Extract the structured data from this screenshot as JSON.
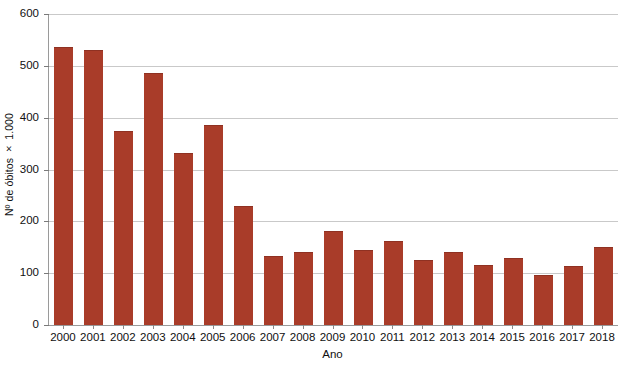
{
  "chart_data": {
    "type": "bar",
    "title": "",
    "xlabel": "Ano",
    "ylabel": "Nº de óbitos × 1.000",
    "categories": [
      "2000",
      "2001",
      "2002",
      "2003",
      "2004",
      "2005",
      "2006",
      "2007",
      "2008",
      "2009",
      "2010",
      "2011",
      "2012",
      "2013",
      "2014",
      "2015",
      "2016",
      "2017",
      "2018"
    ],
    "values": [
      535,
      528,
      373,
      485,
      330,
      384,
      228,
      132,
      139,
      180,
      142,
      161,
      124,
      138,
      113,
      128,
      94,
      111,
      148
    ],
    "ylim": [
      0,
      600
    ],
    "yticks": [
      0,
      100,
      200,
      300,
      400,
      500,
      600
    ],
    "ytick_labels": [
      "0",
      "100",
      "200",
      "300",
      "400",
      "500",
      "600"
    ],
    "grid": true,
    "grid_axis": "y",
    "legend": false,
    "series": [
      {
        "name": "Nº de óbitos × 1.000",
        "color": "#a93c29",
        "values": [
          535,
          528,
          373,
          485,
          330,
          384,
          228,
          132,
          139,
          180,
          142,
          161,
          124,
          138,
          113,
          128,
          94,
          111,
          148
        ]
      }
    ]
  },
  "axes": {
    "y_title": "Nº de óbitos × 1.000",
    "x_title": "Ano"
  },
  "colors": {
    "bar": "#a93c29",
    "gridline": "#c9c9c9",
    "axis": "#9a9a9a",
    "text": "#101010",
    "background": "#ffffff"
  },
  "caption": {
    "text": ""
  }
}
